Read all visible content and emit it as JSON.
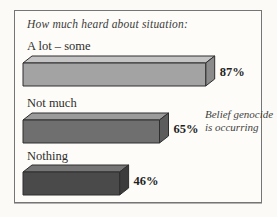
{
  "chart_data": {
    "type": "bar",
    "orientation": "horizontal",
    "style": "3d",
    "title": "How much heard about situation:",
    "categories": [
      "A lot – some",
      "Not much",
      "Nothing"
    ],
    "values": [
      87,
      65,
      46
    ],
    "value_labels": [
      "87%",
      "65%",
      "46%"
    ],
    "unit": "%",
    "xlim": [
      0,
      100
    ],
    "grid": false,
    "legend": false,
    "annotation": "Belief genocide is occurring",
    "annotation_lines": [
      "Belief genocide",
      "is occurring"
    ],
    "bar_styles": [
      {
        "front": "#a3a3a3",
        "top": "#c4c4c4",
        "side": "#8b8b8b"
      },
      {
        "front": "#6f6f6f",
        "top": "#9b9b9b",
        "side": "#5c5c5c"
      },
      {
        "front": "#4a4a4a",
        "top": "#757575",
        "side": "#3c3c3c"
      }
    ],
    "outline_color": "#2e2e2e",
    "panel_background": "#fdfcf8",
    "panel_border_color": "#757575"
  }
}
